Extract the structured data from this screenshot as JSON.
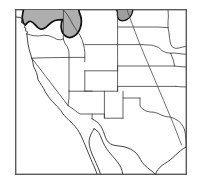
{
  "figure": {
    "kind": "species-distribution-range-map",
    "region": "Western United States",
    "caption": "",
    "width": 199,
    "height": 194
  },
  "colors": {
    "background": "#ffffff",
    "frame_stroke": "#5a5a5a",
    "state_boundary": "#3a3a3a",
    "coastline": "#2e2e2e",
    "river": "#4a4a4a",
    "range_fill": "#aeaeae",
    "range_outline": "#111111"
  },
  "frame": {
    "x": 15,
    "y": 9,
    "width": 172,
    "height": 166
  },
  "legend": {
    "present": false,
    "entries": []
  },
  "labels": {
    "present": false,
    "items": []
  },
  "range_regions": [
    {
      "name": "pacific-northwest-range",
      "description": "Shaded distribution covering northern Washington and the northern Idaho panhandle",
      "fill": "#aeaeae"
    },
    {
      "name": "northern-plains-range",
      "description": "Small shaded distribution patch at the Montana and North Dakota border",
      "fill": "#9e9e9e"
    }
  ],
  "geography": {
    "coastlines": [
      "pacific-coast",
      "baja-california-peninsula",
      "gulf-of-california",
      "gulf-of-mexico-texas-coast"
    ],
    "rivers": [
      "missouri-river"
    ],
    "state_outlines_shown": true
  }
}
